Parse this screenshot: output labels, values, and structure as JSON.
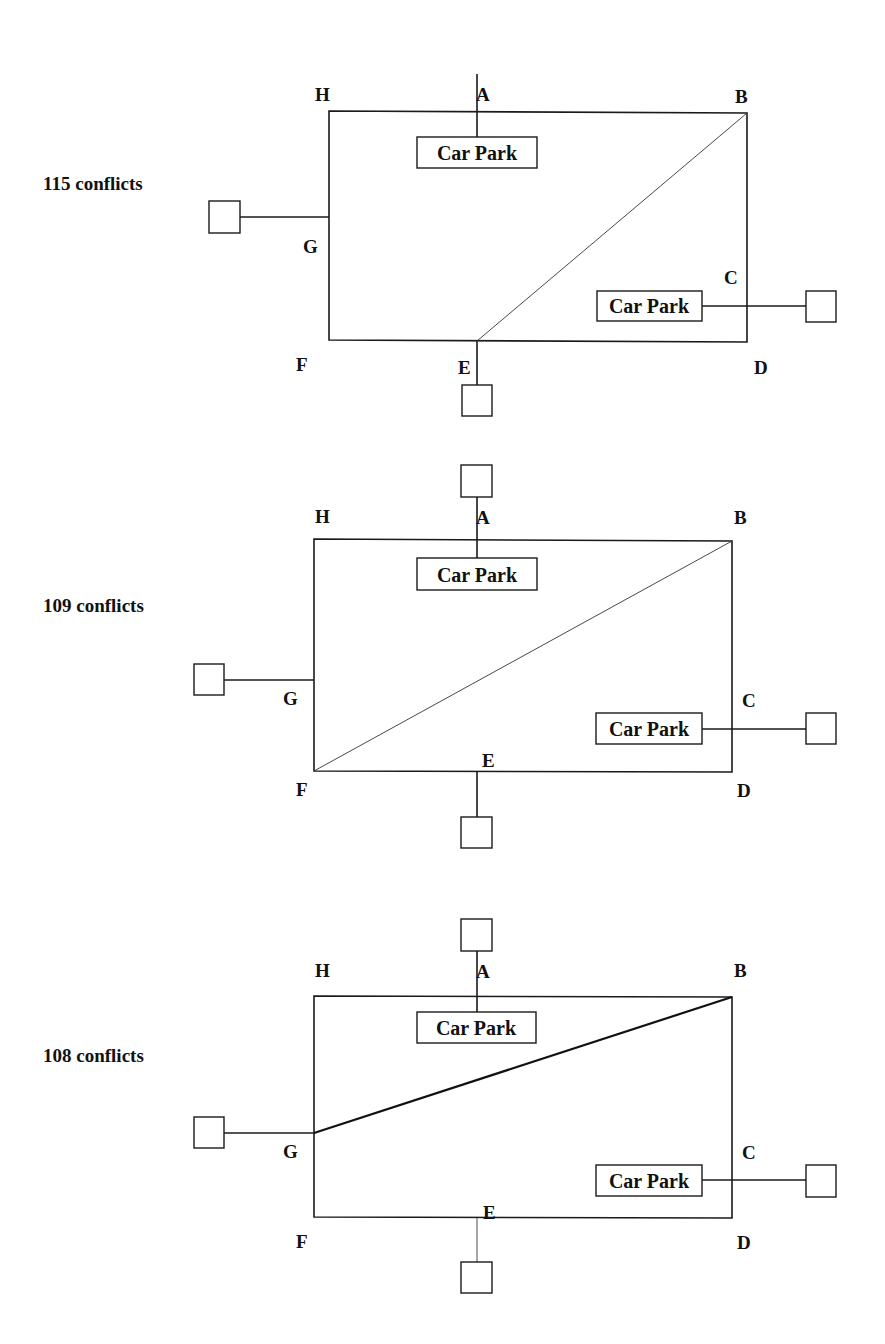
{
  "diagrams": [
    {
      "conflicts_label": "115 conflicts",
      "points": {
        "A": "A",
        "B": "B",
        "C": "C",
        "D": "D",
        "E": "E",
        "F": "F",
        "G": "G",
        "H": "H"
      },
      "car_parks": [
        "Car Park",
        "Car Park"
      ],
      "diagonal": "E to B"
    },
    {
      "conflicts_label": "109 conflicts",
      "points": {
        "A": "A",
        "B": "B",
        "C": "C",
        "D": "D",
        "E": "E",
        "F": "F",
        "G": "G",
        "H": "H"
      },
      "car_parks": [
        "Car Park",
        "Car Park"
      ],
      "diagonal": "F to B"
    },
    {
      "conflicts_label": "108 conflicts",
      "points": {
        "A": "A",
        "B": "B",
        "C": "C",
        "D": "D",
        "E": "E",
        "F": "F",
        "G": "G",
        "H": "H"
      },
      "car_parks": [
        "Car Park",
        "Car Park"
      ],
      "diagonal": "G to B"
    }
  ],
  "colors": {
    "line": "#1a1a1a",
    "background": "#ffffff"
  }
}
